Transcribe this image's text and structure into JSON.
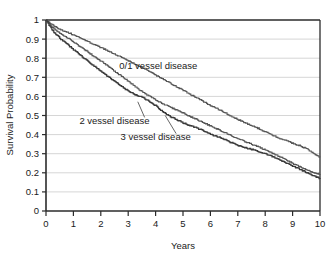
{
  "chart_data": {
    "type": "line",
    "title": "",
    "xlabel": "Years",
    "ylabel": "Survival Probability",
    "xlim": [
      0,
      10
    ],
    "ylim": [
      0,
      1
    ],
    "grid": true,
    "grid_axis": "y",
    "legend_position": "inline-annotations",
    "x_ticks": [
      "0",
      "1",
      "2",
      "3",
      "4",
      "5",
      "6",
      "7",
      "8",
      "9",
      "10"
    ],
    "y_ticks": [
      "0",
      "0.1",
      "0.2",
      "0.3",
      "0.4",
      "0.5",
      "0.6",
      "0.7",
      "0.8",
      "0.9",
      "1"
    ],
    "series": [
      {
        "name": "0/1 vessel disease",
        "color": "#555555",
        "annotation": "0/1 vessel disease",
        "x": [
          0,
          0.25,
          0.5,
          0.75,
          1,
          1.25,
          1.5,
          1.75,
          2,
          2.25,
          2.5,
          2.75,
          3,
          3.25,
          3.5,
          3.75,
          4,
          4.25,
          4.5,
          4.75,
          5,
          5.25,
          5.5,
          5.75,
          6,
          6.25,
          6.5,
          6.75,
          7,
          7.25,
          7.5,
          7.75,
          8,
          8.25,
          8.5,
          8.75,
          9,
          9.25,
          9.5,
          9.75,
          10
        ],
        "values": [
          1.0,
          0.975,
          0.955,
          0.94,
          0.925,
          0.908,
          0.892,
          0.875,
          0.858,
          0.842,
          0.825,
          0.808,
          0.79,
          0.772,
          0.753,
          0.735,
          0.715,
          0.695,
          0.675,
          0.655,
          0.635,
          0.615,
          0.595,
          0.575,
          0.555,
          0.538,
          0.52,
          0.5,
          0.482,
          0.465,
          0.45,
          0.435,
          0.418,
          0.4,
          0.385,
          0.372,
          0.358,
          0.345,
          0.33,
          0.305,
          0.285
        ]
      },
      {
        "name": "2 vessel disease",
        "color": "#555555",
        "annotation": "2 vessel disease",
        "x": [
          0,
          0.25,
          0.5,
          0.75,
          1,
          1.25,
          1.5,
          1.75,
          2,
          2.25,
          2.5,
          2.75,
          3,
          3.25,
          3.5,
          3.75,
          4,
          4.25,
          4.5,
          4.75,
          5,
          5.25,
          5.5,
          5.75,
          6,
          6.25,
          6.5,
          6.75,
          7,
          7.25,
          7.5,
          7.75,
          8,
          8.25,
          8.5,
          8.75,
          9,
          9.25,
          9.5,
          9.75,
          10
        ],
        "values": [
          1.0,
          0.962,
          0.935,
          0.912,
          0.888,
          0.862,
          0.838,
          0.812,
          0.788,
          0.762,
          0.735,
          0.708,
          0.682,
          0.655,
          0.628,
          0.605,
          0.585,
          0.565,
          0.548,
          0.532,
          0.515,
          0.498,
          0.482,
          0.465,
          0.448,
          0.432,
          0.415,
          0.398,
          0.382,
          0.368,
          0.352,
          0.338,
          0.322,
          0.305,
          0.29,
          0.272,
          0.252,
          0.235,
          0.218,
          0.205,
          0.195
        ]
      },
      {
        "name": "3 vessel disease",
        "color": "#3a3a3a",
        "annotation": "3 vessel disease",
        "x": [
          0,
          0.25,
          0.5,
          0.75,
          1,
          1.25,
          1.5,
          1.75,
          2,
          2.25,
          2.5,
          2.75,
          3,
          3.25,
          3.5,
          3.75,
          4,
          4.25,
          4.5,
          4.75,
          5,
          5.25,
          5.5,
          5.75,
          6,
          6.25,
          6.5,
          6.75,
          7,
          7.25,
          7.5,
          7.75,
          8,
          8.25,
          8.5,
          8.75,
          9,
          9.25,
          9.5,
          9.75,
          10
        ],
        "values": [
          1.0,
          0.945,
          0.908,
          0.878,
          0.848,
          0.818,
          0.79,
          0.762,
          0.735,
          0.708,
          0.682,
          0.655,
          0.632,
          0.612,
          0.6,
          0.578,
          0.555,
          0.522,
          0.5,
          0.482,
          0.465,
          0.45,
          0.438,
          0.422,
          0.405,
          0.392,
          0.378,
          0.362,
          0.348,
          0.335,
          0.325,
          0.315,
          0.302,
          0.288,
          0.272,
          0.255,
          0.238,
          0.222,
          0.205,
          0.188,
          0.172
        ]
      }
    ],
    "annotations": [
      {
        "text": "0/1 vessel disease",
        "x": 4.1,
        "y": 0.745,
        "anchor": "middle"
      },
      {
        "text": "2 vessel disease",
        "x": 2.5,
        "y": 0.455,
        "anchor": "middle"
      },
      {
        "text": "3 vessel disease",
        "x": 4.0,
        "y": 0.37,
        "anchor": "middle"
      }
    ],
    "leader_lines": [
      {
        "from_x": 3.6,
        "from_y": 0.49,
        "to_x": 3.35,
        "to_y": 0.572
      },
      {
        "from_x": 4.75,
        "from_y": 0.405,
        "to_x": 4.35,
        "to_y": 0.5
      }
    ]
  },
  "axes": {
    "y_axis_title": "Survival Probability",
    "x_axis_title": "Years"
  },
  "colors": {
    "background": "#ffffff",
    "axis": "#2b2b2b",
    "grid": "#d6d6d6",
    "text": "#1a1a1a"
  }
}
